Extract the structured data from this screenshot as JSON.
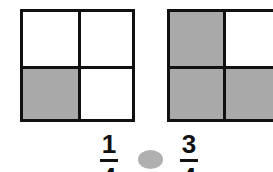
{
  "figure": {
    "left_square": {
      "cells": [
        {
          "row": 0,
          "col": 0,
          "shaded": false
        },
        {
          "row": 0,
          "col": 1,
          "shaded": false
        },
        {
          "row": 1,
          "col": 0,
          "shaded": true
        },
        {
          "row": 1,
          "col": 1,
          "shaded": false
        }
      ],
      "fraction": {
        "numerator": "1",
        "denominator": "4"
      }
    },
    "right_square": {
      "cells": [
        {
          "row": 0,
          "col": 0,
          "shaded": true
        },
        {
          "row": 0,
          "col": 1,
          "shaded": false
        },
        {
          "row": 1,
          "col": 0,
          "shaded": true
        },
        {
          "row": 1,
          "col": 1,
          "shaded": true
        }
      ],
      "fraction": {
        "numerator": "3",
        "denominator": "4"
      }
    },
    "comparison_symbol": "blank-circle",
    "colors": {
      "shade": "#a9a9a9",
      "line": "#111111",
      "circle": "#b0b0b0"
    }
  }
}
